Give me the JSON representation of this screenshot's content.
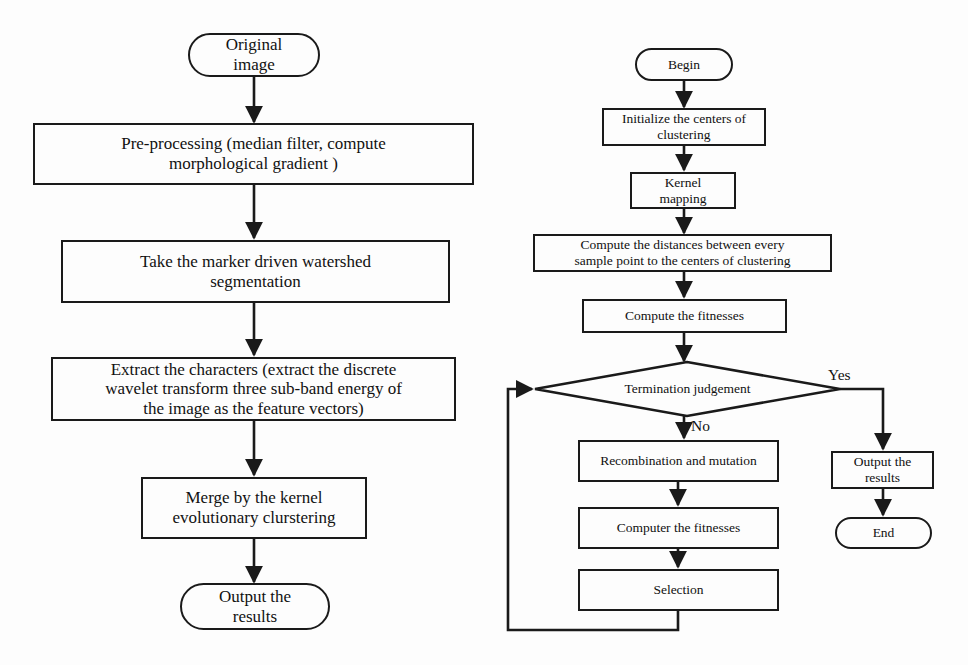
{
  "figure": {
    "kind": "flowchart",
    "panels": [
      {
        "id": "left",
        "name": "image-segmentation-pipeline",
        "nodes": [
          {
            "id": "L1",
            "shape": "terminal",
            "text": "Original\nimage"
          },
          {
            "id": "L2",
            "shape": "process",
            "text": "Pre-processing (median filter, compute\nmorphological gradient )"
          },
          {
            "id": "L3",
            "shape": "process",
            "text": "Take the marker driven watershed\nsegmentation"
          },
          {
            "id": "L4",
            "shape": "process",
            "text": "Extract the characters (extract the discrete\nwavelet transform three sub-band energy of\nthe image as the feature vectors)"
          },
          {
            "id": "L5",
            "shape": "process",
            "text": "Merge by the kernel\nevolutionary clurstering"
          },
          {
            "id": "L6",
            "shape": "terminal",
            "text": "Output the\nresults"
          }
        ],
        "edges": [
          {
            "from": "L1",
            "to": "L2",
            "label": ""
          },
          {
            "from": "L2",
            "to": "L3",
            "label": ""
          },
          {
            "from": "L3",
            "to": "L4",
            "label": ""
          },
          {
            "from": "L4",
            "to": "L5",
            "label": ""
          },
          {
            "from": "L5",
            "to": "L6",
            "label": ""
          }
        ]
      },
      {
        "id": "right",
        "name": "kernel-evolutionary-clustering-algorithm",
        "nodes": [
          {
            "id": "R1",
            "shape": "terminal",
            "text": "Begin"
          },
          {
            "id": "R2",
            "shape": "process",
            "text": "Initialize the centers of\nclustering"
          },
          {
            "id": "R3",
            "shape": "process",
            "text": "Kernel\nmapping"
          },
          {
            "id": "R4",
            "shape": "process",
            "text": "Compute the distances between every\nsample point to the centers of clustering"
          },
          {
            "id": "R5",
            "shape": "process",
            "text": "Compute the fitnesses"
          },
          {
            "id": "R6",
            "shape": "decision",
            "text": "Termination judgement"
          },
          {
            "id": "R7",
            "shape": "process",
            "text": "Recombination and mutation"
          },
          {
            "id": "R8",
            "shape": "process",
            "text": "Computer the fitnesses"
          },
          {
            "id": "R9",
            "shape": "process",
            "text": "Selection"
          },
          {
            "id": "R10",
            "shape": "process",
            "text": "Output the\nresults"
          },
          {
            "id": "R11",
            "shape": "terminal",
            "text": "End"
          }
        ],
        "edges": [
          {
            "from": "R1",
            "to": "R2",
            "label": ""
          },
          {
            "from": "R2",
            "to": "R3",
            "label": ""
          },
          {
            "from": "R3",
            "to": "R4",
            "label": ""
          },
          {
            "from": "R4",
            "to": "R5",
            "label": ""
          },
          {
            "from": "R5",
            "to": "R6",
            "label": ""
          },
          {
            "from": "R6",
            "to": "R7",
            "label": "No"
          },
          {
            "from": "R6",
            "to": "R10",
            "label": "Yes"
          },
          {
            "from": "R7",
            "to": "R8",
            "label": ""
          },
          {
            "from": "R8",
            "to": "R9",
            "label": ""
          },
          {
            "from": "R9",
            "to": "R6",
            "label": ""
          },
          {
            "from": "R10",
            "to": "R11",
            "label": ""
          }
        ]
      }
    ],
    "labels": {
      "yes": "Yes",
      "no": "No"
    },
    "colors": {
      "stroke": "#1a1a1a",
      "text": "#111111",
      "background": "#fdfdfd"
    }
  }
}
